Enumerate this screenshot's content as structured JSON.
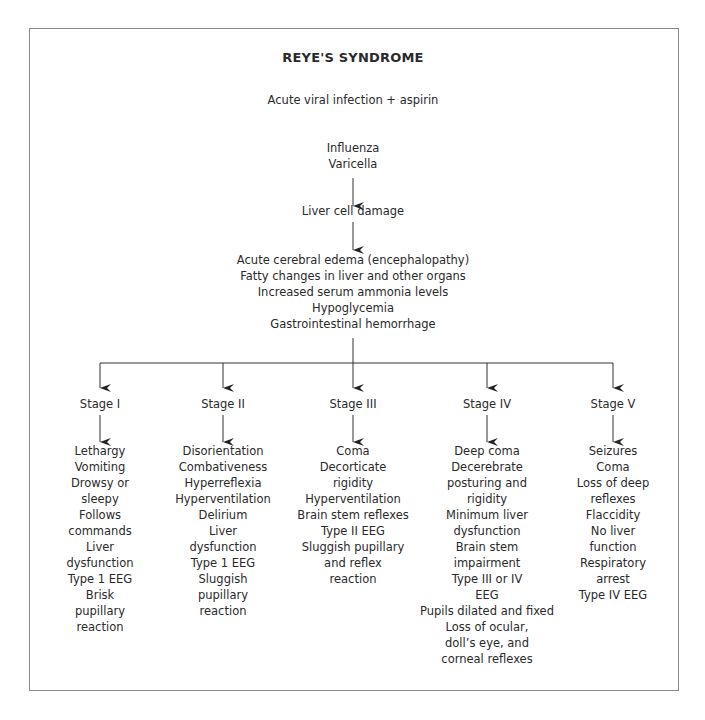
{
  "diagram": {
    "title": "REYE'S SYNDROME",
    "trigger": "Acute viral infection + aspirin",
    "infections": [
      "Influenza",
      "Varicella"
    ],
    "intermediate": "Liver cell damage",
    "effects": [
      "Acute cerebral edema (encephalopathy)",
      "Fatty changes in liver and other organs",
      "Increased serum ammonia levels",
      "Hypoglycemia",
      "Gastrointestinal hemorrhage"
    ],
    "stages": [
      {
        "label": "Stage I",
        "symptoms": [
          "Lethargy",
          "Vomiting",
          "Drowsy or",
          "sleepy",
          "Follows",
          "commands",
          "Liver",
          "dysfunction",
          "Type 1 EEG",
          "Brisk",
          "pupillary",
          "reaction"
        ]
      },
      {
        "label": "Stage II",
        "symptoms": [
          "Disorientation",
          "Combativeness",
          "Hyperreflexia",
          "Hyperventilation",
          "Delirium",
          "Liver",
          "dysfunction",
          "Type 1 EEG",
          "Sluggish",
          "pupillary",
          "reaction"
        ]
      },
      {
        "label": "Stage III",
        "symptoms": [
          "Coma",
          "Decorticate",
          "rigidity",
          "Hyperventilation",
          "Brain stem reflexes",
          "Type II EEG",
          "Sluggish pupillary",
          "and reflex",
          "reaction"
        ]
      },
      {
        "label": "Stage IV",
        "symptoms": [
          "Deep coma",
          "Decerebrate",
          "posturing and",
          "rigidity",
          "Minimum liver",
          "dysfunction",
          "Brain stem",
          "impairment",
          "Type III or IV",
          "EEG",
          "Pupils dilated and fixed",
          "Loss of ocular,",
          "doll’s eye, and",
          "corneal reflexes"
        ]
      },
      {
        "label": "Stage V",
        "symptoms": [
          "Seizures",
          "Coma",
          "Loss of deep",
          "reflexes",
          "Flaccidity",
          "No liver",
          "function",
          "Respiratory",
          "arrest",
          "Type IV EEG"
        ]
      }
    ]
  },
  "colors": {
    "text": "#2a2a2a",
    "lines": "#333333",
    "frame": "#8a8a8a",
    "background": "#ffffff"
  }
}
